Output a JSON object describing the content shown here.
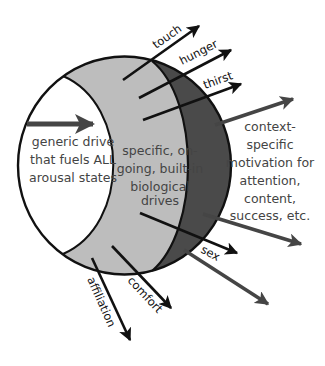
{
  "diagram": {
    "type": "nested-arousal-motivation-diagram",
    "colors": {
      "background": "#ffffff",
      "outline": "#111111",
      "generic_region": "#ffffff",
      "biological_region": "#bdbdbd",
      "context_region": "#4a4a4a",
      "black_arrow": "#111111",
      "gray_arrow": "#454545",
      "region_text": "#444444"
    },
    "regions": {
      "generic": {
        "lines": [
          "generic drive",
          "that fuels ALL",
          "arousal states"
        ]
      },
      "biological": {
        "lines": [
          "specific, on-",
          "going, built-in",
          "biological",
          "drives"
        ]
      },
      "context": {
        "lines": [
          "context-",
          "specific",
          "motivation for",
          "attention,",
          "content,",
          "success, etc."
        ]
      }
    },
    "arrows": {
      "generic": {
        "label": ""
      },
      "touch": {
        "label": "touch"
      },
      "hunger": {
        "label": "hunger"
      },
      "thirst": {
        "label": "thirst"
      },
      "sex": {
        "label": "sex"
      },
      "comfort": {
        "label": "comfort"
      },
      "affiliation": {
        "label": "affiliation"
      },
      "context_upper": {
        "label": ""
      },
      "context_lower_1": {
        "label": ""
      },
      "context_lower_2": {
        "label": ""
      }
    }
  }
}
